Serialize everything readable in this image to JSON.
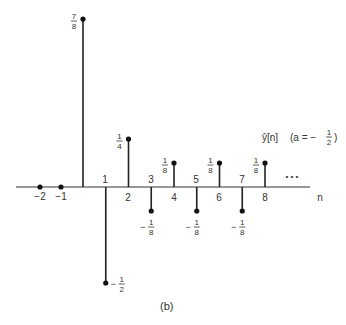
{
  "chart_data": {
    "type": "stem",
    "signal_label": "ŷ[n]",
    "parameter_label": "(a = −1/2)",
    "xlabel": "n",
    "ylabel": "",
    "caption": "(b)",
    "x": [
      -2,
      -1,
      0,
      1,
      2,
      3,
      4,
      5,
      6,
      7,
      8
    ],
    "values": [
      0,
      0,
      0.875,
      -0.5,
      0.25,
      -0.125,
      0.125,
      -0.125,
      0.125,
      -0.125,
      0.125
    ],
    "value_labels": [
      "",
      "",
      "7/8",
      "-1/2",
      "1/4",
      "-1/8",
      "1/8",
      "-1/8",
      "1/8",
      "-1/8",
      "1/8"
    ],
    "tick_labels": [
      "-2",
      "-1",
      "1",
      "2",
      "3",
      "4",
      "5",
      "6",
      "7",
      "8"
    ],
    "continuation": "• • •",
    "grid": false
  },
  "labels": {
    "signal": "ŷ[n]",
    "param_prefix": "(a = −",
    "param_num": "1",
    "param_den": "2",
    "param_suffix": ")",
    "axis": "n",
    "caption": "(b)",
    "dots": "• • •"
  }
}
